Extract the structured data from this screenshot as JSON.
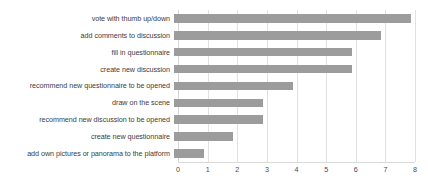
{
  "chart_data": {
    "type": "bar",
    "orientation": "horizontal",
    "title": "",
    "subtitle": "",
    "xlabel": "",
    "ylabel": "",
    "xlim": [
      0,
      8
    ],
    "xticks": [
      "0",
      "1",
      "2",
      "3",
      "4",
      "5",
      "6",
      "7",
      "8"
    ],
    "grid": "vertical",
    "legend": "none",
    "bar_color": "#9c9c9c",
    "gridline_color": "#e2e2e2",
    "background_color": "#ffffff",
    "text_color": "#404040",
    "categories": [
      "vote with thumb up/down",
      "add comments to discussion",
      "fill in questionnaire",
      "create new discussion",
      "recommend new questionnaire to be opened",
      "draw on the scene",
      "recommend new discussion to be opened",
      "create new questionnaire",
      "add own pictures or panorama to the platform"
    ],
    "values": [
      8,
      7,
      6,
      6,
      4,
      3,
      3,
      2,
      1
    ]
  }
}
